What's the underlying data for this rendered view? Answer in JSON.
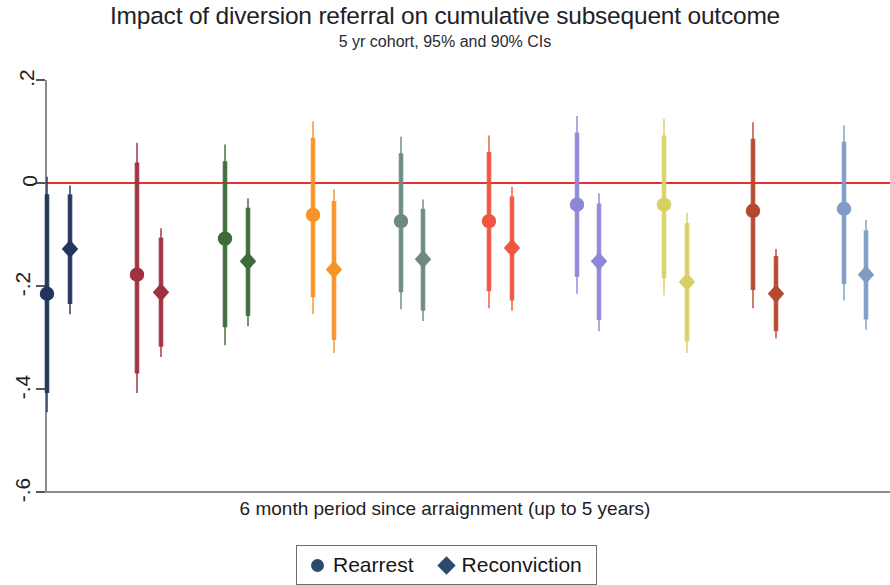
{
  "chart_data": {
    "type": "scatter",
    "title": "Impact of diversion referral on cumulative subsequent outcome",
    "subtitle": "5 yr cohort, 95% and 90% CIs",
    "xlabel": "6 month period since arraignment (up to 5 years)",
    "ylabel": "",
    "ylim": [
      -0.6,
      0.2
    ],
    "y_ticks": [
      0.2,
      0,
      -0.2,
      -0.4,
      -0.6
    ],
    "y_tick_labels": [
      ".2",
      "0",
      "-.2",
      "-.4",
      "-.6"
    ],
    "grid": false,
    "zero_reference_line": 0,
    "zero_reference_color": "#e8312a",
    "legend_position": "bottom-center",
    "legend": [
      {
        "label": "Rearrest",
        "marker": "circle",
        "color": "#2e4a6b"
      },
      {
        "label": "Reconviction",
        "marker": "diamond",
        "color": "#2e4a6b"
      }
    ],
    "categories": [
      "1",
      "2",
      "3",
      "4",
      "5",
      "6",
      "7",
      "8",
      "9",
      "10"
    ],
    "series": [
      {
        "name": "Rearrest",
        "marker": "circle",
        "values": [
          -0.215,
          -0.178,
          -0.108,
          -0.062,
          -0.074,
          -0.074,
          -0.042,
          -0.042,
          -0.054,
          -0.05
        ],
        "ci95_low": [
          -0.445,
          -0.408,
          -0.315,
          -0.255,
          -0.245,
          -0.243,
          -0.215,
          -0.218,
          -0.243,
          -0.228
        ],
        "ci95_high": [
          0.012,
          0.078,
          0.075,
          0.12,
          0.09,
          0.092,
          0.13,
          0.125,
          0.118,
          0.112
        ],
        "ci90_low": [
          -0.408,
          -0.37,
          -0.28,
          -0.222,
          -0.212,
          -0.21,
          -0.182,
          -0.185,
          -0.208,
          -0.196
        ],
        "ci90_high": [
          -0.022,
          0.04,
          0.042,
          0.088,
          0.058,
          0.06,
          0.098,
          0.092,
          0.086,
          0.08
        ]
      },
      {
        "name": "Reconviction",
        "marker": "diamond",
        "values": [
          -0.128,
          -0.212,
          -0.152,
          -0.168,
          -0.148,
          -0.126,
          -0.152,
          -0.192,
          -0.215,
          -0.178
        ],
        "ci95_low": [
          -0.255,
          -0.338,
          -0.278,
          -0.33,
          -0.268,
          -0.248,
          -0.288,
          -0.33,
          -0.302,
          -0.285
        ],
        "ci95_high": [
          -0.005,
          -0.088,
          -0.03,
          -0.012,
          -0.032,
          -0.008,
          -0.02,
          -0.058,
          -0.128,
          -0.072
        ],
        "ci90_low": [
          -0.235,
          -0.318,
          -0.258,
          -0.305,
          -0.248,
          -0.228,
          -0.266,
          -0.308,
          -0.288,
          -0.265
        ],
        "ci90_high": [
          -0.022,
          -0.106,
          -0.048,
          -0.035,
          -0.05,
          -0.026,
          -0.04,
          -0.078,
          -0.142,
          -0.092
        ]
      }
    ],
    "group_colors": [
      "#23355a",
      "#9d3240",
      "#3f6b3a",
      "#f79327",
      "#6d8a82",
      "#f0553f",
      "#8d88d6",
      "#d8d067",
      "#b5492e",
      "#7e9cc4"
    ],
    "group_x_circle": [
      47,
      137,
      225,
      313,
      401,
      489,
      577,
      664,
      753,
      844
    ],
    "group_x_diamond": [
      70,
      161,
      248,
      334,
      423,
      512,
      599,
      687,
      776,
      866
    ]
  },
  "axis": {
    "y_labels": [
      ".2",
      "0",
      "-.2",
      "-.4",
      "-.6"
    ]
  },
  "titles": {
    "main": "Impact of diversion referral on cumulative subsequent outcome",
    "sub": "5 yr cohort, 95% and 90% CIs",
    "xaxis": "6 month period since arraignment (up to 5 years)"
  },
  "legend": {
    "rearrest": "Rearrest",
    "reconviction": "Reconviction"
  }
}
